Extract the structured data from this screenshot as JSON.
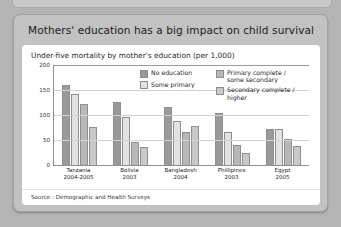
{
  "panel": {
    "title": "Mothers' education has a big impact on child survival"
  },
  "card": {
    "subtitle": "Under-five mortality by mother's education (per 1,000)",
    "source": "Source : Demographic and Health Surveys"
  },
  "legend": {
    "items": [
      {
        "label": "No education",
        "color": "#9a9a9a"
      },
      {
        "label": "Some primary",
        "color": "#e2e2e2"
      },
      {
        "label": "Primary complete /\nsome secondary",
        "color": "#b8b8b8"
      },
      {
        "label": "Secondary complete /\nhigher",
        "color": "#c9c9c9"
      }
    ]
  },
  "chart_data": {
    "type": "bar",
    "title": "Under-five mortality by mother's education (per 1,000)",
    "xlabel": "",
    "ylabel": "",
    "ylim": [
      0,
      200
    ],
    "yticks": [
      0,
      50,
      100,
      150,
      200
    ],
    "grid": true,
    "legend_position": "top-right",
    "categories": [
      "Tanzania",
      "Bolivia",
      "Bangladesh",
      "Phillipines",
      "Egypt"
    ],
    "category_years": [
      "2004-2005",
      "2003",
      "2004",
      "2003",
      "2005"
    ],
    "series": [
      {
        "name": "No education",
        "color": "#9a9a9a",
        "values": [
          161,
          127,
          116,
          104,
          72
        ]
      },
      {
        "name": "Some primary",
        "color": "#e2e2e2",
        "values": [
          143,
          97,
          88,
          67,
          72
        ]
      },
      {
        "name": "Primary complete / some secondary",
        "color": "#b8b8b8",
        "values": [
          122,
          47,
          67,
          41,
          53
        ]
      },
      {
        "name": "Secondary complete / higher",
        "color": "#c9c9c9",
        "values": [
          76,
          37,
          78,
          25,
          38
        ]
      }
    ]
  }
}
